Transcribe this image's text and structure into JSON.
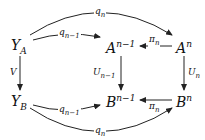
{
  "diagram": {
    "type": "commutative-diagram",
    "nodes": {
      "YA": {
        "base": "Y",
        "sub": "A",
        "sup": ""
      },
      "An1": {
        "base": "A",
        "sub": "",
        "sup": "n−1"
      },
      "An": {
        "base": "A",
        "sub": "",
        "sup": "n"
      },
      "YB": {
        "base": "Y",
        "sub": "B",
        "sup": ""
      },
      "Bn1": {
        "base": "B",
        "sub": "",
        "sup": "n−1"
      },
      "Bn": {
        "base": "B",
        "sub": "",
        "sup": "n"
      }
    },
    "arrows": {
      "qn_top": {
        "base": "q",
        "sub": "n",
        "from": "YA",
        "to": "An"
      },
      "qn1_top": {
        "base": "q",
        "sub": "n−1",
        "from": "YA",
        "to": "An1"
      },
      "pin_top": {
        "base": "π",
        "sub": "n",
        "from": "An",
        "to": "An1"
      },
      "V": {
        "base": "V",
        "sub": "",
        "from": "YA",
        "to": "YB"
      },
      "Un1": {
        "base": "U",
        "sub": "n−1",
        "from": "An1",
        "to": "Bn1"
      },
      "Un": {
        "base": "U",
        "sub": "n",
        "from": "An",
        "to": "Bn"
      },
      "qn1_bot": {
        "base": "q",
        "sub": "n−1",
        "from": "YB",
        "to": "Bn1"
      },
      "pin_bot": {
        "base": "π",
        "sub": "n",
        "from": "Bn",
        "to": "Bn1"
      },
      "qn_bot": {
        "base": "q",
        "sub": "n",
        "from": "YB",
        "to": "Bn"
      }
    }
  }
}
